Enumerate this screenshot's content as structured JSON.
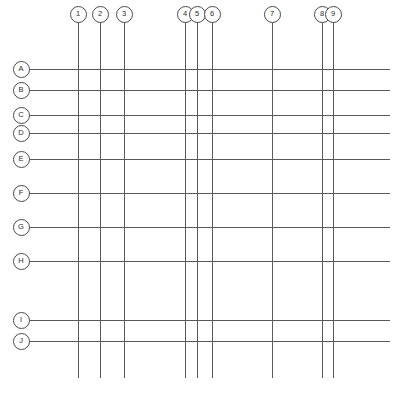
{
  "drawing": {
    "type": "architectural-structural-grid",
    "caption": "",
    "sheet_width": 397,
    "sheet_height": 396,
    "line_color": "#5a5a5a",
    "bubble_border_color": "#4a4a4a",
    "bubble_fill_color": "#ffffff",
    "text_color": "#2b2b2b",
    "background_color": "#ffffff"
  },
  "column_grid": {
    "axis_label": "",
    "extent_top": 22,
    "extent_bottom": 378,
    "bubble_center_y": 14,
    "lines": [
      {
        "label": "1",
        "x": 78
      },
      {
        "label": "2",
        "x": 100
      },
      {
        "label": "3",
        "x": 124
      },
      {
        "label": "4",
        "x": 185
      },
      {
        "label": "5",
        "x": 197
      },
      {
        "label": "6",
        "x": 212
      },
      {
        "label": "7",
        "x": 272
      },
      {
        "label": "8",
        "x": 322
      },
      {
        "label": "9",
        "x": 333
      }
    ]
  },
  "row_grid": {
    "axis_label": "",
    "extent_left": 28,
    "extent_right": 390,
    "bubble_center_x": 21,
    "lines": [
      {
        "label": "A",
        "y": 69
      },
      {
        "label": "B",
        "y": 90
      },
      {
        "label": "C",
        "y": 115
      },
      {
        "label": "D",
        "y": 133
      },
      {
        "label": "E",
        "y": 159
      },
      {
        "label": "F",
        "y": 193
      },
      {
        "label": "G",
        "y": 227
      },
      {
        "label": "H",
        "y": 261
      },
      {
        "label": "I",
        "y": 320
      },
      {
        "label": "J",
        "y": 341
      }
    ]
  }
}
